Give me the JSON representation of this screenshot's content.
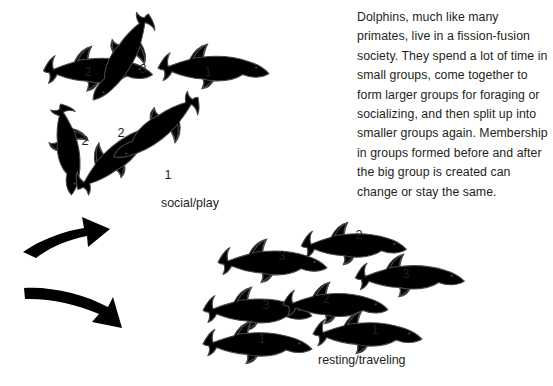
{
  "figure": {
    "background_color": "#ffffff",
    "ink_color": "#231f20",
    "dolphin_fill_grey": "#c9c9c9",
    "dolphin_fill_white": "#ffffff",
    "dolphin_outline": "#4a4a4a"
  },
  "caption": {
    "text": "Dolphins, much like many primates, live in a fission-fusion society. They spend a lot of time in small groups, come together to form larger groups for foraging or socializing, and then split up into smaller groups again. Membership in groups formed before and after the big group is created can change or stay the same."
  },
  "groups": [
    {
      "id": "social-play",
      "label": "social/play",
      "label_position": {
        "x": 161,
        "y": 196
      },
      "dolphins": [
        {
          "number": "2",
          "fill": "grey",
          "label_x": 88,
          "label_y": 73
        },
        {
          "number": "3",
          "fill": "white",
          "label_x": 143,
          "label_y": 70
        },
        {
          "number": "1",
          "fill": "grey",
          "label_x": 208,
          "label_y": 73
        },
        {
          "number": "2",
          "fill": "white",
          "label_x": 85,
          "label_y": 142
        },
        {
          "number": "2",
          "fill": "white",
          "label_x": 121,
          "label_y": 134
        },
        {
          "number": "1",
          "fill": "grey",
          "label_x": 168,
          "label_y": 176
        }
      ]
    },
    {
      "id": "resting-traveling",
      "label": "resting/traveling",
      "label_position": {
        "x": 318,
        "y": 353
      },
      "dolphins": [
        {
          "number": "2",
          "fill": "grey",
          "label_x": 359,
          "label_y": 236
        },
        {
          "number": "3",
          "fill": "grey",
          "label_x": 282,
          "label_y": 257
        },
        {
          "number": "3",
          "fill": "white",
          "label_x": 406,
          "label_y": 275
        },
        {
          "number": "3",
          "fill": "grey",
          "label_x": 266,
          "label_y": 306
        },
        {
          "number": "2",
          "fill": "white",
          "label_x": 326,
          "label_y": 300
        },
        {
          "number": "1",
          "fill": "white",
          "label_x": 262,
          "label_y": 340
        },
        {
          "number": "1",
          "fill": "grey",
          "label_x": 375,
          "label_y": 331
        }
      ]
    }
  ],
  "arrows": [
    {
      "id": "arrow-up",
      "direction": "up-right",
      "color": "#000000"
    },
    {
      "id": "arrow-down",
      "direction": "down-right",
      "color": "#000000"
    }
  ]
}
